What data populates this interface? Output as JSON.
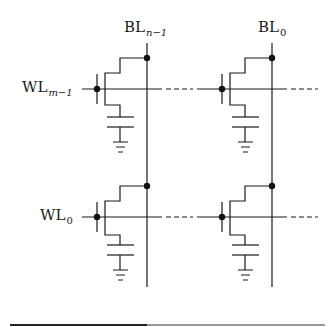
{
  "diagram": {
    "type": "DRAM cell array schematic",
    "bitlines": [
      {
        "id": "bl_left",
        "label_main": "BL",
        "label_sub": "n−1",
        "x": 147
      },
      {
        "id": "bl_right",
        "label_main": "BL",
        "label_sub": "0",
        "x": 272
      }
    ],
    "wordlines": [
      {
        "id": "wl_top",
        "label_main": "WL",
        "label_sub": "m−1",
        "y": 89
      },
      {
        "id": "wl_bottom",
        "label_main": "WL",
        "label_sub": "0",
        "y": 217
      }
    ],
    "cells": [
      {
        "row": "wl_top",
        "col": "bl_left",
        "components": [
          "access-transistor",
          "storage-capacitor",
          "ground"
        ]
      },
      {
        "row": "wl_top",
        "col": "bl_right",
        "components": [
          "access-transistor",
          "storage-capacitor",
          "ground"
        ]
      },
      {
        "row": "wl_bottom",
        "col": "bl_left",
        "components": [
          "access-transistor",
          "storage-capacitor",
          "ground"
        ]
      },
      {
        "row": "wl_bottom",
        "col": "bl_right",
        "components": [
          "access-transistor",
          "storage-capacitor",
          "ground"
        ]
      }
    ],
    "continuation": "dashed wordline segments indicate additional columns",
    "colors": {
      "line": "#1a1a1a",
      "rule_dark": "#222222",
      "rule_light": "#9a9a9a",
      "background": "#ffffff"
    }
  }
}
